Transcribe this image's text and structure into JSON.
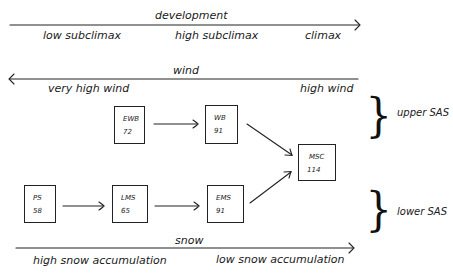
{
  "axes": {
    "development": {
      "title": "development",
      "direction": "right",
      "labels": [
        "low subclimax",
        "high subclimax",
        "climax"
      ]
    },
    "wind": {
      "title": "wind",
      "direction": "left",
      "labels": [
        "very high wind",
        "high wind"
      ]
    },
    "snow": {
      "title": "snow",
      "direction": "right",
      "labels": [
        "high snow accumulation",
        "low snow accumulation"
      ]
    }
  },
  "nodes": [
    {
      "id": "EWB",
      "name": "EWB",
      "value": "72"
    },
    {
      "id": "WB",
      "name": "WB",
      "value": "91"
    },
    {
      "id": "MSC",
      "name": "MSC",
      "value": "114"
    },
    {
      "id": "PS",
      "name": "PS",
      "value": "58"
    },
    {
      "id": "LMS",
      "name": "LMS",
      "value": "65"
    },
    {
      "id": "EMS",
      "name": "EMS",
      "value": "91"
    }
  ],
  "edges": [
    {
      "from": "EWB",
      "to": "WB"
    },
    {
      "from": "WB",
      "to": "MSC"
    },
    {
      "from": "PS",
      "to": "LMS"
    },
    {
      "from": "LMS",
      "to": "EMS"
    },
    {
      "from": "EMS",
      "to": "MSC"
    }
  ],
  "groups": {
    "upper": "upper SAS",
    "lower": "lower SAS"
  }
}
